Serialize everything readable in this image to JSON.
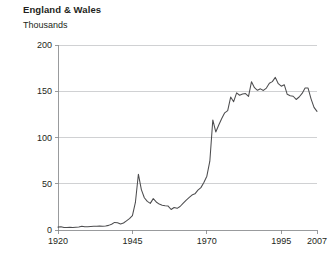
{
  "chart_data": {
    "type": "line",
    "title": "England & Wales",
    "subtitle": "",
    "ylabel": "Thousands",
    "xlabel": "",
    "ylim": [
      0,
      200
    ],
    "xlim": [
      1920,
      2007
    ],
    "yticks": [
      0,
      50,
      100,
      150,
      200
    ],
    "ytick_labels": [
      "0",
      "50",
      "100",
      "150",
      "200"
    ],
    "xticks": [
      1920,
      1945,
      1970,
      1995,
      2007
    ],
    "xtick_labels": [
      "1920",
      "1945",
      "1970",
      "1995",
      "2007"
    ],
    "grid": "horizontal",
    "legend": "none",
    "series": [
      {
        "name": "Divorces",
        "color": "#4d4d4f",
        "x": [
          1920,
          1921,
          1922,
          1923,
          1924,
          1925,
          1926,
          1927,
          1928,
          1929,
          1930,
          1931,
          1932,
          1933,
          1934,
          1935,
          1936,
          1937,
          1938,
          1939,
          1940,
          1941,
          1942,
          1943,
          1944,
          1945,
          1946,
          1947,
          1948,
          1949,
          1950,
          1951,
          1952,
          1953,
          1954,
          1955,
          1956,
          1957,
          1958,
          1959,
          1960,
          1961,
          1962,
          1963,
          1964,
          1965,
          1966,
          1967,
          1968,
          1969,
          1970,
          1971,
          1972,
          1973,
          1974,
          1975,
          1976,
          1977,
          1978,
          1979,
          1980,
          1981,
          1982,
          1983,
          1984,
          1985,
          1986,
          1987,
          1988,
          1989,
          1990,
          1991,
          1992,
          1993,
          1994,
          1995,
          1996,
          1997,
          1998,
          1999,
          2000,
          2001,
          2002,
          2003,
          2004,
          2005,
          2006,
          2007
        ],
        "values": [
          3.1,
          3.5,
          2.6,
          2.7,
          2.9,
          2.8,
          3.0,
          3.2,
          4.0,
          3.4,
          3.6,
          3.8,
          4.0,
          4.1,
          4.3,
          4.1,
          4.3,
          5.0,
          6.2,
          8.2,
          7.8,
          6.4,
          7.6,
          9.9,
          12.3,
          15.6,
          29.8,
          60.3,
          43.7,
          34.9,
          30.9,
          28.8,
          33.9,
          30.3,
          28.0,
          26.8,
          26.3,
          25.9,
          22.2,
          24.3,
          23.4,
          25.4,
          28.7,
          32.1,
          34.9,
          37.8,
          39.1,
          43.1,
          45.8,
          51.3,
          58.2,
          74.4,
          119.0,
          106.0,
          113.5,
          120.5,
          126.7,
          129.1,
          143.7,
          138.7,
          148.3,
          145.7,
          147.0,
          147.5,
          144.5,
          160.3,
          153.9,
          151.0,
          152.6,
          150.9,
          153.4,
          158.7,
          160.4,
          165.0,
          158.2,
          155.5,
          157.1,
          146.7,
          145.2,
          144.6,
          141.1,
          143.8,
          147.7,
          153.5,
          153.4,
          141.8,
          132.6,
          128.2
        ]
      }
    ]
  },
  "plot_geometry": {
    "left": 58,
    "right": 317,
    "top": 45,
    "bottom": 230
  }
}
